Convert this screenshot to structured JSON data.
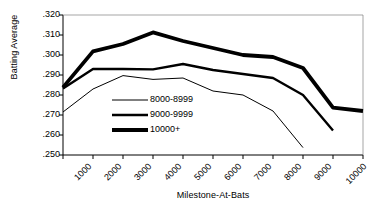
{
  "chart_data": {
    "type": "line",
    "title": "",
    "xlabel": "Milestone-At-Bats",
    "ylabel": "Batting Average",
    "x": [
      1000,
      2000,
      3000,
      4000,
      5000,
      6000,
      7000,
      8000,
      9000,
      10000,
      11000
    ],
    "categories": [
      "1000",
      "2000",
      "3000",
      "4000",
      "5000",
      "6000",
      "7000",
      "8000",
      "9000",
      "10000",
      "11000"
    ],
    "xlim": [
      1000,
      11000
    ],
    "ylim": [
      0.25,
      0.32
    ],
    "ytick_values": [
      0.32,
      0.31,
      0.3,
      0.29,
      0.28,
      0.27,
      0.26,
      0.25
    ],
    "ytick_labels": [
      ".320",
      ".310",
      ".300",
      ".290",
      ".280",
      ".270",
      ".260",
      ".250"
    ],
    "grid": false,
    "legend_position": "center-left",
    "series": [
      {
        "name": "8000-8999",
        "style": "thin",
        "line_width": 1,
        "color": "#000000",
        "x": [
          1000,
          2000,
          3000,
          4000,
          5000,
          6000,
          7000,
          8000,
          9000
        ],
        "values": [
          0.2715,
          0.283,
          0.2897,
          0.2878,
          0.2885,
          0.282,
          0.28,
          0.272,
          0.2537
        ]
      },
      {
        "name": "9000-9999",
        "style": "medium",
        "line_width": 2.4,
        "color": "#000000",
        "x": [
          1000,
          2000,
          3000,
          4000,
          5000,
          6000,
          7000,
          8000,
          9000,
          10000
        ],
        "values": [
          0.2832,
          0.293,
          0.293,
          0.2928,
          0.2955,
          0.2925,
          0.2905,
          0.2885,
          0.28,
          0.2622
        ]
      },
      {
        "name": "10000+",
        "style": "thick",
        "line_width": 3.8,
        "color": "#000000",
        "x": [
          1000,
          2000,
          3000,
          4000,
          5000,
          6000,
          7000,
          8000,
          9000,
          10000,
          11000
        ],
        "values": [
          0.2838,
          0.3018,
          0.3055,
          0.3113,
          0.307,
          0.3035,
          0.3,
          0.299,
          0.2935,
          0.2737,
          0.272
        ]
      }
    ]
  },
  "legend": {
    "items": [
      {
        "label": "8000-8999"
      },
      {
        "label": "9000-9999"
      },
      {
        "label": "10000+"
      }
    ]
  }
}
